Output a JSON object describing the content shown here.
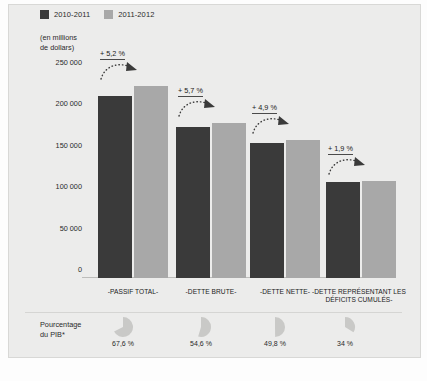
{
  "legend": {
    "items": [
      {
        "label": "2010-2011",
        "color": "#3a3a3a",
        "swatch_name": "legend-swatch-dark"
      },
      {
        "label": "2011-2012",
        "color": "#a8a8a8",
        "swatch_name": "legend-swatch-light"
      }
    ]
  },
  "axis_unit": {
    "line1": "(en millions",
    "line2": "de dollars)"
  },
  "pib_row": {
    "line1": "Pourcentage",
    "line2": "du PIB*"
  },
  "footnote": {
    "text": ""
  },
  "colors": {
    "series_2010_2011": "#3a3a3a",
    "series_2011_2012": "#a8a8a8",
    "panel_background": "#ececeb",
    "pie_fill": "#c9c9c7",
    "text": "#2a2a2a"
  },
  "chart_data": {
    "type": "bar",
    "title": "",
    "subtitle": "",
    "xlabel": "",
    "ylabel": "(en millions de dollars)",
    "ylim": [
      0,
      250000
    ],
    "grid": false,
    "legend_position": "top-left",
    "yticks": [
      "0",
      "50 000",
      "100 000",
      "150 000",
      "200 000",
      "250 000"
    ],
    "ytick_values": [
      0,
      50000,
      100000,
      150000,
      200000,
      250000
    ],
    "categories": [
      "-PASSIF TOTAL-",
      "-DETTE BRUTE-",
      "-DETTE NETTE-",
      "-DETTE REPRÉSENTANT LES DÉFICITS CUMULÉS-"
    ],
    "series": [
      {
        "name": "2010-2011",
        "color": "#3a3a3a",
        "values": [
          220000,
          182000,
          163000,
          116000
        ]
      },
      {
        "name": "2011-2012",
        "color": "#a8a8a8",
        "values": [
          231500,
          187500,
          166500,
          117000
        ]
      }
    ],
    "annotations": [
      {
        "label": "+ 5,2 %",
        "category": "-PASSIF TOTAL-"
      },
      {
        "label": "+ 5,7 %",
        "category": "-DETTE BRUTE-"
      },
      {
        "label": "+ 4,9 %",
        "category": "-DETTE NETTE-"
      },
      {
        "label": "+ 1,9 %",
        "category": "-DETTE REPRÉSENTANT LES DÉFICITS CUMULÉS-"
      }
    ],
    "pib_percentages": [
      {
        "label": "67,6 %",
        "value": 67.6
      },
      {
        "label": "54,6 %",
        "value": 54.6
      },
      {
        "label": "49,8 %",
        "value": 49.8
      },
      {
        "label": "34 %",
        "value": 34
      }
    ]
  }
}
